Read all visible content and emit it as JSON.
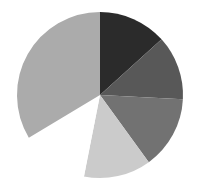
{
  "chart_data": {
    "type": "pie",
    "title": "",
    "legend": [],
    "start_angle_deg": 0,
    "direction": "clockwise",
    "center": [
      100,
      95
    ],
    "radius": 83,
    "labels": [
      "Slice 1",
      "Slice 2",
      "Slice 3",
      "Slice 4",
      "Slice 5",
      "Slice 6"
    ],
    "values": [
      13.3,
      12.5,
      14.2,
      13.1,
      13.3,
      33.6
    ],
    "colors": [
      "#2b2b2b",
      "#585858",
      "#727272",
      "#cbcbcb",
      "#ffffff",
      "#ababab"
    ]
  }
}
